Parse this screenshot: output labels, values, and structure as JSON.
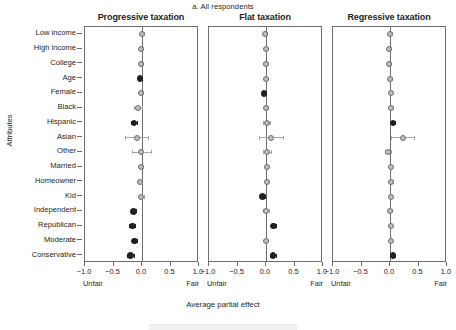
{
  "subtitle": "a. All respondents",
  "axis": {
    "y_title": "Attributes",
    "x_title": "Average partial effect",
    "left_anchor": "Unfair",
    "right_anchor": "Fair",
    "tick_labels": [
      "−1.0",
      "−0.5",
      "0.0",
      "0.5",
      "1.0"
    ],
    "tick_values": [
      -1.0,
      -0.5,
      0.0,
      0.5,
      1.0
    ]
  },
  "colors": {
    "significant": "#231f20",
    "nonsignificant": "#bcbec0",
    "marker_edge": "#6d6e71",
    "error_bar": "#a7a9ac",
    "panel_border": "#6d6e71",
    "background": "#ffffff"
  },
  "chart_data": {
    "type": "scatter",
    "title": "a. All respondents",
    "xlabel": "Average partial effect",
    "ylabel": "Attributes",
    "xlim": [
      -1.0,
      1.0
    ],
    "grid": false,
    "legend_position": "none",
    "categories": [
      "Low income",
      "High income",
      "College",
      "Age",
      "Female",
      "Black",
      "Hispanic",
      "Asian",
      "Other",
      "Married",
      "Homeowner",
      "Kid",
      "Independent",
      "Republican",
      "Moderate",
      "Conservative"
    ],
    "panels": [
      {
        "name": "Progressive taxation",
        "values": [
          0.0,
          -0.01,
          -0.01,
          -0.03,
          -0.01,
          -0.07,
          -0.14,
          -0.09,
          -0.01,
          -0.02,
          -0.03,
          -0.01,
          -0.15,
          -0.17,
          -0.13,
          -0.2
        ],
        "ci_low": [
          -0.03,
          -0.04,
          -0.04,
          -0.06,
          -0.04,
          -0.14,
          -0.19,
          -0.29,
          -0.17,
          -0.05,
          -0.06,
          -0.05,
          -0.2,
          -0.22,
          -0.17,
          -0.26
        ],
        "ci_high": [
          0.03,
          0.02,
          0.02,
          0.0,
          0.02,
          0.0,
          -0.09,
          0.11,
          0.15,
          0.01,
          0.0,
          0.03,
          -0.1,
          -0.12,
          -0.09,
          -0.14
        ],
        "significant": [
          false,
          false,
          false,
          true,
          false,
          false,
          true,
          false,
          false,
          false,
          false,
          false,
          true,
          true,
          true,
          true
        ]
      },
      {
        "name": "Flat taxation",
        "values": [
          -0.01,
          0.0,
          0.0,
          0.0,
          -0.03,
          0.0,
          0.01,
          0.08,
          0.01,
          0.01,
          0.01,
          -0.06,
          0.0,
          0.13,
          0.0,
          0.12
        ],
        "ci_low": [
          -0.04,
          -0.03,
          -0.03,
          -0.03,
          -0.06,
          -0.03,
          -0.05,
          -0.13,
          -0.06,
          -0.02,
          -0.02,
          -0.1,
          -0.05,
          0.08,
          -0.03,
          0.07
        ],
        "ci_high": [
          0.02,
          0.03,
          0.03,
          0.03,
          0.0,
          0.03,
          0.07,
          0.29,
          0.08,
          0.04,
          0.04,
          -0.02,
          0.05,
          0.18,
          0.03,
          0.17
        ],
        "significant": [
          false,
          false,
          false,
          false,
          true,
          false,
          false,
          false,
          false,
          false,
          false,
          true,
          false,
          true,
          false,
          true
        ]
      },
      {
        "name": "Regressive taxation",
        "values": [
          0.0,
          -0.01,
          -0.01,
          0.0,
          0.01,
          0.02,
          0.05,
          0.22,
          -0.04,
          0.01,
          0.02,
          0.01,
          0.0,
          0.01,
          0.01,
          0.05
        ],
        "ci_low": [
          -0.03,
          -0.04,
          -0.04,
          -0.03,
          -0.02,
          -0.01,
          0.02,
          0.02,
          -0.09,
          -0.02,
          -0.01,
          -0.02,
          -0.03,
          -0.02,
          -0.02,
          0.02
        ],
        "ci_high": [
          0.03,
          0.02,
          0.02,
          0.03,
          0.04,
          0.05,
          0.08,
          0.42,
          0.01,
          0.04,
          0.05,
          0.04,
          0.03,
          0.04,
          0.04,
          0.08
        ],
        "significant": [
          false,
          false,
          false,
          false,
          false,
          false,
          true,
          false,
          false,
          false,
          false,
          false,
          false,
          false,
          false,
          true
        ]
      }
    ]
  }
}
